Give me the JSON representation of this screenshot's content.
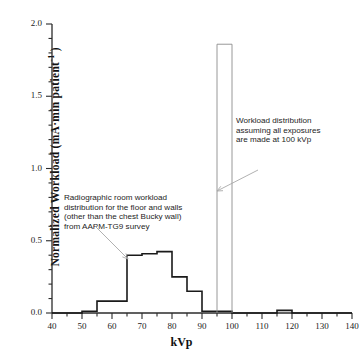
{
  "chart_data": {
    "type": "bar",
    "title": "",
    "xlabel": "kVp",
    "ylabel": "Normalized Workload (mA·min patient",
    "ylabel_exponent": "-1",
    "ylabel_close": ")",
    "xlim": [
      40,
      140
    ],
    "ylim": [
      0.0,
      2.0
    ],
    "xticks": [
      40,
      50,
      60,
      70,
      80,
      90,
      100,
      110,
      120,
      130,
      140
    ],
    "xtick_minor_step": 5,
    "yticks": [
      0.0,
      0.5,
      1.0,
      1.5,
      2.0
    ],
    "ytick_labels": [
      "0.0",
      "0.5",
      "1.0",
      "1.5",
      "2.0"
    ],
    "ytick_minor_step": 0.1,
    "grid": false,
    "legend": null,
    "series": [
      {
        "name": "Radiographic room workload distribution (AAPM-TG9 survey)",
        "style": "step-histogram",
        "color": "#1a1a1a",
        "line_width": 1.6,
        "bin_edges": [
          40,
          45,
          50,
          55,
          60,
          65,
          70,
          75,
          80,
          85,
          90,
          95,
          100,
          105,
          110,
          115,
          120,
          125,
          130,
          135,
          140
        ],
        "values": [
          0.0,
          0.0,
          0.012,
          0.082,
          0.082,
          0.4,
          0.41,
          0.425,
          0.25,
          0.15,
          0.012,
          0.012,
          0.0,
          0.0,
          0.0,
          0.018,
          0.0,
          0.0,
          0.0,
          0.0
        ]
      },
      {
        "name": "Workload distribution assuming all exposures are made at 100 kVp",
        "style": "single-bar-outline",
        "color": "#8c8c8c",
        "line_width": 0.9,
        "bin_edges": [
          95,
          100
        ],
        "values": [
          1.86
        ]
      }
    ],
    "annotations": [
      {
        "id": "annotation-left",
        "text": "Radiographic room workload\ndistribution for the floor and walls\n(other than the chest Bucky wall)\nfrom AAPM-TG9 survey",
        "arrow": {
          "from": [
            93,
            224
          ],
          "to": [
            128,
            259
          ],
          "color": "#a8a8a8"
        }
      },
      {
        "id": "annotation-right",
        "text": "Workload distribution\nassuming all exposures\nare made at 100 kVp",
        "arrow": {
          "from": [
            258,
            170
          ],
          "to": [
            217,
            191
          ],
          "color": "#a8a8a8"
        }
      }
    ]
  },
  "axis": {
    "x_title": "kVp",
    "y_title_main": "Normalized Workload (mA·min patient",
    "y_title_sup": "-1",
    "y_title_end": " )"
  },
  "colors": {
    "axis": "#2b2b2b",
    "histogram": "#1a1a1a",
    "tall_bar": "#8c8c8c",
    "arrow": "#a8a8a8",
    "background": "#ffffff"
  }
}
